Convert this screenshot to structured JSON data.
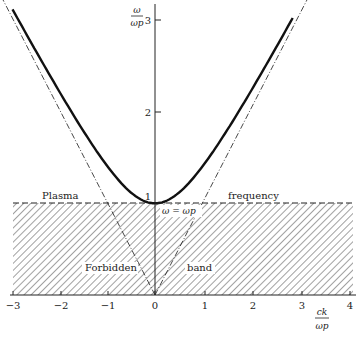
{
  "chart_data": {
    "type": "line",
    "title": "",
    "xlabel": "ck/ωp",
    "ylabel": "ω/ωp",
    "xlim": [
      -3,
      4
    ],
    "ylim": [
      0,
      3.2
    ],
    "x_ticks": [
      -3,
      -2,
      -1,
      0,
      1,
      2,
      3,
      4
    ],
    "y_ticks": [
      1,
      2,
      3
    ],
    "grid": false,
    "legend": null,
    "series": [
      {
        "name": "Dispersion relation ω² = ωp² + c²k²",
        "style": "solid-thick",
        "x": [
          -3,
          -2.5,
          -2,
          -1.5,
          -1,
          -0.5,
          0,
          0.5,
          1,
          1.5,
          2,
          2.5,
          2.85
        ],
        "y": [
          3.16,
          2.69,
          2.24,
          1.8,
          1.41,
          1.12,
          1.0,
          1.12,
          1.41,
          1.8,
          2.24,
          2.69,
          3.02
        ]
      },
      {
        "name": "Light line ω = ck (asymptotes)",
        "style": "dash-dot",
        "x": [
          -3.2,
          0,
          3.2
        ],
        "y": [
          3.2,
          0,
          3.2
        ]
      },
      {
        "name": "Plasma frequency ω = ωp",
        "style": "dashed",
        "x": [
          -3,
          4
        ],
        "y": [
          1,
          1
        ]
      }
    ],
    "regions": [
      {
        "name": "Forbidden band",
        "y_range": [
          0,
          1
        ],
        "fill": "hatched"
      }
    ],
    "annotations": [
      {
        "text": "Plasma",
        "x": -2.3,
        "y": 1.05
      },
      {
        "text": "frequency",
        "x": 1.8,
        "y": 1.05
      },
      {
        "text": "ω = ωp",
        "x": 0.45,
        "y": 0.93
      },
      {
        "text": "Forbidden",
        "x": -1.2,
        "y": 0.3
      },
      {
        "text": "band",
        "x": 0.95,
        "y": 0.3
      }
    ]
  },
  "labels": {
    "y_axis_num": "ω",
    "y_axis_den": "ωp",
    "x_axis_num": "ck",
    "x_axis_den": "ωp",
    "plasma": "Plasma",
    "frequency": "frequency",
    "omega_eq": "ω = ωp",
    "forbidden": "Forbidden",
    "band": "band",
    "xt": [
      "−3",
      "−2",
      "−1",
      "0",
      "1",
      "2",
      "3",
      "4"
    ],
    "yt": [
      "1",
      "2",
      "3"
    ]
  }
}
